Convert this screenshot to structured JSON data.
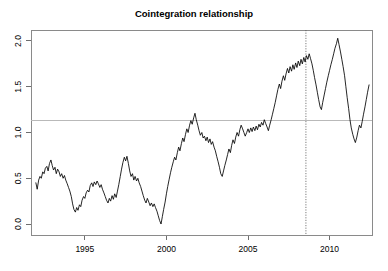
{
  "chart_data": {
    "type": "line",
    "title": "Cointegration relationship",
    "xlabel": "",
    "ylabel": "",
    "xlim": [
      1991.7,
      2012.6
    ],
    "ylim": [
      -0.12,
      2.12
    ],
    "grid": false,
    "legend": null,
    "x_ticks": [
      1995,
      2000,
      2005,
      2010
    ],
    "x_tick_labels": [
      "1995",
      "2000",
      "2005",
      "2010"
    ],
    "y_ticks": [
      0.0,
      0.5,
      1.0,
      1.5,
      2.0
    ],
    "y_tick_labels": [
      "0.0",
      "0.5",
      "1.0",
      "1.5",
      "2.0"
    ],
    "annotations": [
      {
        "name": "equilibrium-level-line",
        "type": "hline",
        "value": 1.13,
        "style": "solid",
        "color": "#b9b9b9"
      },
      {
        "name": "structural-break-line",
        "type": "vline",
        "value": 2008.55,
        "style": "dotted",
        "color": "#5a5a5a"
      }
    ],
    "series": [
      {
        "name": "cointegration-residual",
        "color": "#000000",
        "x": [
          1992.0,
          1992.08,
          1992.17,
          1992.25,
          1992.33,
          1992.42,
          1992.5,
          1992.58,
          1992.67,
          1992.75,
          1992.83,
          1992.92,
          1993.0,
          1993.08,
          1993.17,
          1993.25,
          1993.33,
          1993.42,
          1993.5,
          1993.58,
          1993.67,
          1993.75,
          1993.83,
          1993.92,
          1994.0,
          1994.08,
          1994.17,
          1994.25,
          1994.33,
          1994.42,
          1994.5,
          1994.58,
          1994.67,
          1994.75,
          1994.83,
          1994.92,
          1995.0,
          1995.08,
          1995.17,
          1995.25,
          1995.33,
          1995.42,
          1995.5,
          1995.58,
          1995.67,
          1995.75,
          1995.83,
          1995.92,
          1996.0,
          1996.08,
          1996.17,
          1996.25,
          1996.33,
          1996.42,
          1996.5,
          1996.58,
          1996.67,
          1996.75,
          1996.83,
          1996.92,
          1997.0,
          1997.08,
          1997.17,
          1997.25,
          1997.33,
          1997.42,
          1997.5,
          1997.58,
          1997.67,
          1997.75,
          1997.83,
          1997.92,
          1998.0,
          1998.08,
          1998.17,
          1998.25,
          1998.33,
          1998.42,
          1998.5,
          1998.58,
          1998.67,
          1998.75,
          1998.83,
          1998.92,
          1999.0,
          1999.08,
          1999.17,
          1999.25,
          1999.33,
          1999.42,
          1999.5,
          1999.58,
          1999.67,
          1999.75,
          1999.83,
          1999.92,
          2000.0,
          2000.08,
          2000.17,
          2000.25,
          2000.33,
          2000.42,
          2000.5,
          2000.58,
          2000.67,
          2000.75,
          2000.83,
          2000.92,
          2001.0,
          2001.08,
          2001.17,
          2001.25,
          2001.33,
          2001.42,
          2001.5,
          2001.58,
          2001.67,
          2001.75,
          2001.83,
          2001.92,
          2002.0,
          2002.08,
          2002.17,
          2002.25,
          2002.33,
          2002.42,
          2002.5,
          2002.58,
          2002.67,
          2002.75,
          2002.83,
          2002.92,
          2003.0,
          2003.08,
          2003.17,
          2003.25,
          2003.33,
          2003.42,
          2003.5,
          2003.58,
          2003.67,
          2003.75,
          2003.83,
          2003.92,
          2004.0,
          2004.08,
          2004.17,
          2004.25,
          2004.33,
          2004.42,
          2004.5,
          2004.58,
          2004.67,
          2004.75,
          2004.83,
          2004.92,
          2005.0,
          2005.08,
          2005.17,
          2005.25,
          2005.33,
          2005.42,
          2005.5,
          2005.58,
          2005.67,
          2005.75,
          2005.83,
          2005.92,
          2006.0,
          2006.08,
          2006.17,
          2006.25,
          2006.33,
          2006.42,
          2006.5,
          2006.58,
          2006.67,
          2006.75,
          2006.83,
          2006.92,
          2007.0,
          2007.08,
          2007.17,
          2007.25,
          2007.33,
          2007.42,
          2007.5,
          2007.58,
          2007.67,
          2007.75,
          2007.83,
          2007.92,
          2008.0,
          2008.08,
          2008.17,
          2008.25,
          2008.33,
          2008.42,
          2008.5,
          2008.58,
          2008.67,
          2008.75,
          2008.83,
          2008.92,
          2009.0,
          2009.08,
          2009.17,
          2009.25,
          2009.33,
          2009.42,
          2009.5,
          2009.58,
          2009.67,
          2009.75,
          2009.83,
          2009.92,
          2010.0,
          2010.08,
          2010.17,
          2010.25,
          2010.33,
          2010.42,
          2010.5,
          2010.58,
          2010.67,
          2010.75,
          2010.83,
          2010.92,
          2011.0,
          2011.08,
          2011.17,
          2011.25,
          2011.33,
          2011.42,
          2011.5,
          2011.58,
          2011.67,
          2011.75,
          2011.83,
          2011.92,
          2012.0,
          2012.08,
          2012.17,
          2012.25,
          2012.33,
          2012.42
        ],
        "y": [
          0.45,
          0.38,
          0.48,
          0.52,
          0.5,
          0.57,
          0.55,
          0.61,
          0.63,
          0.58,
          0.66,
          0.7,
          0.64,
          0.59,
          0.62,
          0.55,
          0.6,
          0.57,
          0.52,
          0.55,
          0.5,
          0.53,
          0.48,
          0.44,
          0.4,
          0.36,
          0.3,
          0.22,
          0.16,
          0.13,
          0.18,
          0.15,
          0.21,
          0.19,
          0.26,
          0.3,
          0.28,
          0.34,
          0.37,
          0.35,
          0.42,
          0.45,
          0.41,
          0.46,
          0.43,
          0.47,
          0.44,
          0.4,
          0.43,
          0.38,
          0.34,
          0.3,
          0.26,
          0.23,
          0.28,
          0.25,
          0.31,
          0.27,
          0.33,
          0.29,
          0.36,
          0.43,
          0.52,
          0.6,
          0.67,
          0.73,
          0.69,
          0.74,
          0.66,
          0.58,
          0.52,
          0.55,
          0.48,
          0.52,
          0.47,
          0.5,
          0.45,
          0.41,
          0.36,
          0.31,
          0.26,
          0.23,
          0.28,
          0.24,
          0.2,
          0.23,
          0.19,
          0.22,
          0.18,
          0.14,
          0.09,
          0.04,
          0.0,
          0.08,
          0.16,
          0.24,
          0.33,
          0.41,
          0.49,
          0.56,
          0.62,
          0.68,
          0.73,
          0.7,
          0.78,
          0.84,
          0.8,
          0.88,
          0.94,
          0.9,
          0.98,
          1.04,
          1.0,
          1.08,
          1.13,
          1.09,
          1.16,
          1.21,
          1.14,
          1.08,
          1.02,
          0.97,
          1.0,
          0.94,
          0.96,
          0.91,
          0.95,
          0.89,
          0.93,
          0.87,
          0.9,
          0.84,
          0.8,
          0.74,
          0.68,
          0.62,
          0.55,
          0.52,
          0.58,
          0.64,
          0.7,
          0.76,
          0.82,
          0.78,
          0.86,
          0.92,
          0.88,
          0.95,
          1.0,
          0.96,
          1.03,
          1.08,
          1.04,
          1.0,
          0.96,
          1.0,
          1.04,
          1.0,
          1.05,
          1.01,
          1.06,
          1.02,
          1.07,
          1.03,
          1.09,
          1.06,
          1.11,
          1.08,
          1.14,
          1.1,
          1.06,
          1.02,
          1.08,
          1.14,
          1.2,
          1.26,
          1.33,
          1.4,
          1.47,
          1.53,
          1.48,
          1.56,
          1.62,
          1.57,
          1.64,
          1.7,
          1.65,
          1.72,
          1.67,
          1.74,
          1.69,
          1.76,
          1.71,
          1.78,
          1.73,
          1.8,
          1.75,
          1.82,
          1.77,
          1.84,
          1.8,
          1.86,
          1.81,
          1.75,
          1.68,
          1.6,
          1.52,
          1.44,
          1.36,
          1.28,
          1.25,
          1.33,
          1.41,
          1.48,
          1.55,
          1.62,
          1.68,
          1.74,
          1.8,
          1.86,
          1.92,
          1.97,
          2.03,
          1.96,
          1.88,
          1.8,
          1.72,
          1.62,
          1.5,
          1.38,
          1.26,
          1.14,
          1.05,
          0.98,
          0.93,
          0.89,
          0.95,
          1.02,
          1.08,
          1.05,
          1.12,
          1.2,
          1.28,
          1.36,
          1.44,
          1.52
        ]
      }
    ]
  },
  "figure": {
    "title": "Cointegration relationship"
  }
}
